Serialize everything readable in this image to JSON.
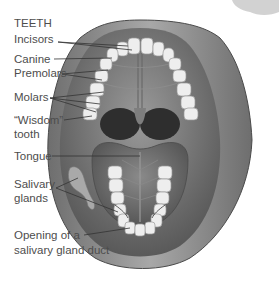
{
  "diagram": {
    "section_heading": "TEETH",
    "labels": {
      "incisors": "Incisors",
      "canine": "Canine",
      "premolars": "Premolars",
      "molars": "Molars",
      "wisdom_line1": "“Wisdom”",
      "wisdom_line2": "tooth",
      "tongue": "Tongue",
      "salivary_line1": "Salivary",
      "salivary_line2": "glands",
      "duct_line1": "Opening of a",
      "duct_line2": "salivary gland duct"
    },
    "colors": {
      "background": "#ffffff",
      "text": "#4d4d4d",
      "leader_line": "#333333",
      "lip": "#8c8c8c",
      "lip_dark": "#5e5e5e",
      "palate": "#7a7a7a",
      "throat": "#2e2e2e",
      "tongue": "#6f6f6f",
      "tooth": "#eeeeee",
      "tooth_edge": "#9a9a9a"
    }
  }
}
